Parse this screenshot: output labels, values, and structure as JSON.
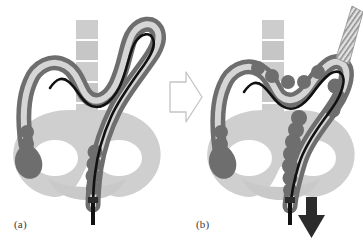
{
  "figure": {
    "background_color": "#ffffff",
    "panels": [
      {
        "id": "a",
        "caption": "(a)",
        "description": "Sigmoid loop formed: the colonoscope shaft has bowed into a large alpha/N-shaped loop, stretching the sigmoid colon upward out of the pelvis.",
        "state": "looped"
      },
      {
        "id": "b",
        "caption": "(b)",
        "description": "Loop reduced: withdrawing and torquing the shaft pleats the colon back onto a straightened scope, and the scope shaft is drawn out of the anus.",
        "state": "straightened"
      }
    ],
    "transition_arrow": {
      "name": "transition-arrow",
      "direction": "right",
      "style": "outline",
      "stroke_color": "#bdbdbd",
      "fill_color": "#ffffff"
    },
    "withdrawal_arrow": {
      "name": "withdrawal-arrow",
      "direction": "down",
      "style": "solid",
      "fill_color": "#2b2b2b",
      "meaning": "scope withdrawal / loop reduction"
    },
    "colors": {
      "colon_wall": "#6e6e6e",
      "colon_wall_dark": "#5e5e5e",
      "colon_lumen": "#d8d8d8",
      "pelvis_bone": "#cfcfcf",
      "pelvis_bone_shadow": "#c2c2c2",
      "foramen": "#ffffff",
      "vertebra": "#c9c9c9",
      "scope_line": "#111111",
      "scope_shaft_hatch": "#9a9a9a",
      "caption_text": "#3a3a3a"
    },
    "anatomy_labels": {
      "colon": "colon",
      "sigmoid_loop": "sigmoid loop",
      "rectum": "rectum",
      "anus": "anus",
      "pelvis": "pelvis",
      "sacrum_vertebrae": "sacrum / lumbar vertebrae",
      "caecum": "caecum",
      "scope": "colonoscope shaft",
      "scope_handle_end": "scope shaft exiting anus"
    }
  }
}
